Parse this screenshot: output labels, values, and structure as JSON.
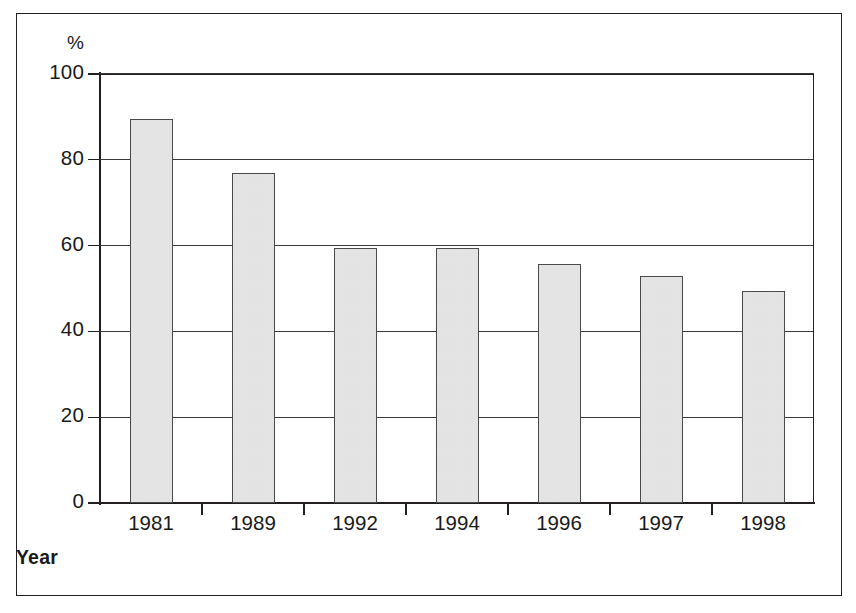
{
  "chart_data": {
    "type": "bar",
    "title": "",
    "subtitle": "",
    "xlabel": "Year",
    "ylabel": "%",
    "categories": [
      "1981",
      "1989",
      "1992",
      "1994",
      "1996",
      "1997",
      "1998"
    ],
    "values": [
      89.5,
      77.0,
      59.5,
      59.5,
      55.7,
      53.0,
      49.5
    ],
    "ylim": [
      0,
      100
    ],
    "y_ticks": [
      0,
      20,
      40,
      60,
      80,
      100
    ],
    "y_tick_labels": [
      "0",
      "20",
      "40",
      "60",
      "80",
      "100"
    ],
    "grid": "horizontal",
    "legend": "none",
    "series": [
      {
        "name": "",
        "values": [
          89.5,
          77.0,
          59.5,
          59.5,
          55.7,
          53.0,
          49.5
        ]
      }
    ],
    "annotations": [],
    "colors": {
      "bar_fill": "#e9e9e9",
      "bar_edge": "#4a4a4a",
      "axis": "#231f20",
      "gridline": "#3a3a3a",
      "text": "#1a1a1a",
      "background": "#ffffff",
      "frame": "#221f1f"
    }
  },
  "axes": {
    "y_unit_label": "%",
    "x_title": "Year"
  }
}
